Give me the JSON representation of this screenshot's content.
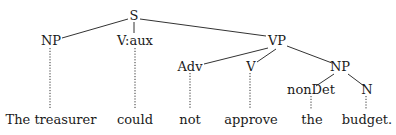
{
  "diagram": {
    "type": "syntax-tree",
    "nodes": {
      "s": {
        "label": "S"
      },
      "np_subject": {
        "label": "NP"
      },
      "v_aux": {
        "label": "V:aux"
      },
      "vp": {
        "label": "VP"
      },
      "adv": {
        "label": "Adv"
      },
      "v": {
        "label": "V"
      },
      "np_object": {
        "label": "NP"
      },
      "non_det": {
        "label": "nonDet"
      },
      "n": {
        "label": "N"
      }
    },
    "leaves": {
      "the_treasurer": {
        "label": "The treasurer"
      },
      "could": {
        "label": "could"
      },
      "not": {
        "label": "not"
      },
      "approve": {
        "label": "approve"
      },
      "the": {
        "label": "the"
      },
      "budget": {
        "label": "budget."
      }
    },
    "edges": [
      [
        "S",
        "NP"
      ],
      [
        "S",
        "V:aux"
      ],
      [
        "S",
        "VP"
      ],
      [
        "VP",
        "Adv"
      ],
      [
        "VP",
        "V"
      ],
      [
        "VP",
        "NP"
      ],
      [
        "NP",
        "nonDet"
      ],
      [
        "NP",
        "N"
      ]
    ],
    "lexical_links": [
      [
        "NP",
        "The treasurer"
      ],
      [
        "V:aux",
        "could"
      ],
      [
        "Adv",
        "not"
      ],
      [
        "V",
        "approve"
      ],
      [
        "nonDet",
        "the"
      ],
      [
        "N",
        "budget."
      ]
    ]
  }
}
